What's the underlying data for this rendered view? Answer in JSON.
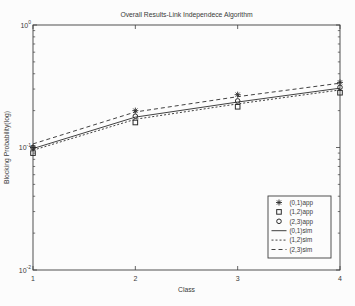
{
  "figure": {
    "background": "#fcfcfc",
    "axis_color": "#3f3f3f",
    "text_color": "#3a3a3a",
    "series_color": "#2b2b2b"
  },
  "chart_data": {
    "type": "line",
    "title": "Overall Results-Link Independece Algorithm",
    "xlabel": "Class",
    "ylabel": "Blocking Probability(log)",
    "x_scale": "linear",
    "y_scale": "log",
    "xlim": [
      1,
      4
    ],
    "ylim": [
      0.01,
      1
    ],
    "grid": false,
    "xticks": [
      1,
      2,
      3,
      4
    ],
    "yticks": [
      {
        "value": 1,
        "label_base": "10",
        "label_exp": "0"
      },
      {
        "value": 0.1,
        "label_base": "10",
        "label_exp": "-1"
      },
      {
        "value": 0.01,
        "label_base": "10",
        "label_exp": "-2"
      }
    ],
    "x": [
      1,
      2,
      3,
      4
    ],
    "series": [
      {
        "name": "(0,1)app",
        "style": "markers",
        "marker": "asterisk",
        "values": [
          0.1,
          0.2,
          0.27,
          0.34
        ]
      },
      {
        "name": "(1,2)app",
        "style": "markers",
        "marker": "square",
        "values": [
          0.09,
          0.16,
          0.215,
          0.28
        ]
      },
      {
        "name": "(2,3)app",
        "style": "markers",
        "marker": "circle",
        "values": [
          0.1,
          0.18,
          0.24,
          0.31
        ]
      },
      {
        "name": "(0,1)sim",
        "style": "line",
        "dash": "solid",
        "values": [
          0.098,
          0.177,
          0.235,
          0.305
        ]
      },
      {
        "name": "(1,2)sim",
        "style": "line",
        "dash": "fine-dash",
        "values": [
          0.095,
          0.17,
          0.227,
          0.295
        ]
      },
      {
        "name": "(2,3)sim",
        "style": "line",
        "dash": "dash",
        "values": [
          0.107,
          0.195,
          0.26,
          0.335
        ]
      }
    ],
    "legend": {
      "position": "lower-right",
      "entries": [
        "(0,1)app",
        "(1,2)app",
        "(2,3)app",
        "(0,1)sim",
        "(1,2)sim",
        "(2,3)sim"
      ]
    }
  }
}
